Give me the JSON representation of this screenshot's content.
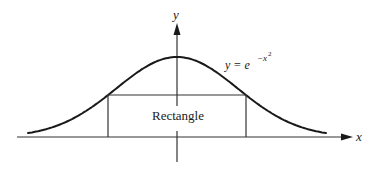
{
  "figure": {
    "colors": {
      "ink": "#1a1a1a",
      "axis": "#333333",
      "background": "#ffffff"
    }
  },
  "axes": {
    "x_label": "x",
    "y_label": "y"
  },
  "curve": {
    "equation_lhs": "y = e",
    "equation_exponent": "−x",
    "equation_exponent_power": "2",
    "function": "gaussian"
  },
  "rectangle": {
    "label": "Rectangle"
  }
}
